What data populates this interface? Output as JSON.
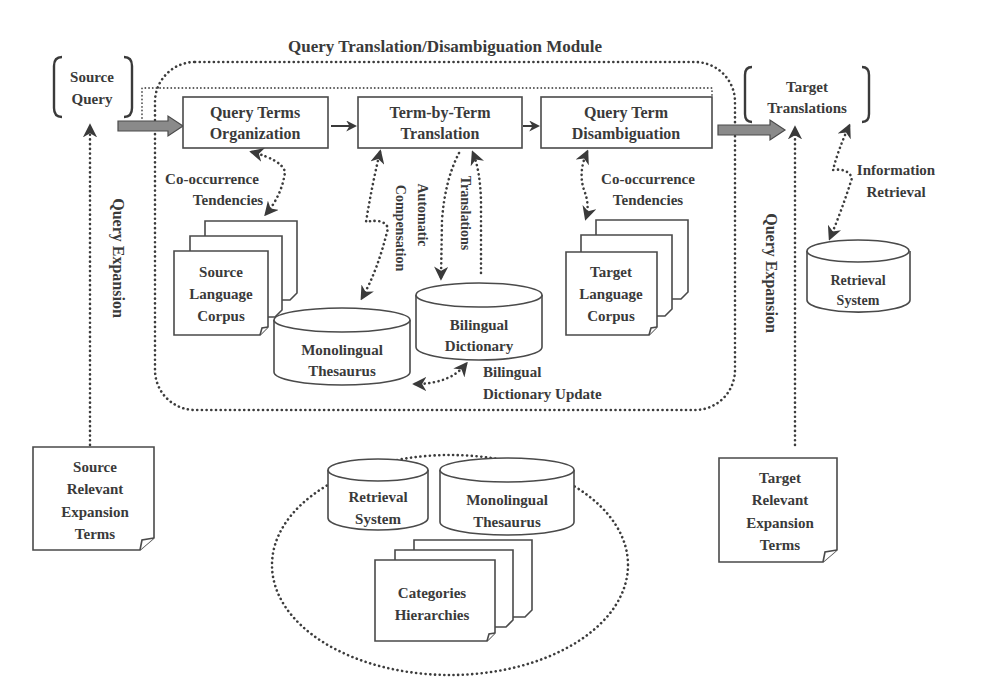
{
  "title": "Query Translation/Disambiguation Module",
  "source_query": {
    "line1": "Source",
    "line2": "Query"
  },
  "target_translations": {
    "line1": "Target",
    "line2": "Translations"
  },
  "process_boxes": [
    {
      "line1": "Query Terms",
      "line2": "Organization"
    },
    {
      "line1": "Term-by-Term",
      "line2": "Translation"
    },
    {
      "line1": "Query Term",
      "line2": "Disambiguation"
    }
  ],
  "source_corpus": {
    "line1": "Source",
    "line2": "Language",
    "line3": "Corpus"
  },
  "target_corpus": {
    "line1": "Target",
    "line2": "Language",
    "line3": "Corpus"
  },
  "monolingual_thesaurus": {
    "line1": "Monolingual",
    "line2": "Thesaurus"
  },
  "bilingual_dictionary": {
    "line1": "Bilingual",
    "line2": "Dictionary"
  },
  "retrieval_system": {
    "line1": "Retrieval",
    "line2": "System"
  },
  "edge_labels": {
    "cooccurrence_left": {
      "line1": "Co-occurrence",
      "line2": "Tendencies"
    },
    "cooccurrence_right": {
      "line1": "Co-occurrence",
      "line2": "Tendencies"
    },
    "compensation": "Compensation",
    "automatic": "Automatic",
    "translations": "Translations",
    "bilingual_update": {
      "line1": "Bilingual",
      "line2": "Dictionary Update"
    },
    "information_retrieval": {
      "line1": "Information",
      "line2": "Retrieval"
    },
    "query_expansion_left": "Query Expansion",
    "query_expansion_right": "Query Expansion"
  },
  "source_expansion_terms": {
    "line1": "Source",
    "line2": "Relevant",
    "line3": "Expansion",
    "line4": "Terms"
  },
  "target_expansion_terms": {
    "line1": "Target",
    "line2": "Relevant",
    "line3": "Expansion",
    "line4": "Terms"
  },
  "resources": {
    "retrieval_system": {
      "line1": "Retrieval",
      "line2": "System"
    },
    "monolingual_thesaurus": {
      "line1": "Monolingual",
      "line2": "Thesaurus"
    },
    "categories_hierarchies": {
      "line1": "Categories",
      "line2": "Hierarchies"
    }
  }
}
